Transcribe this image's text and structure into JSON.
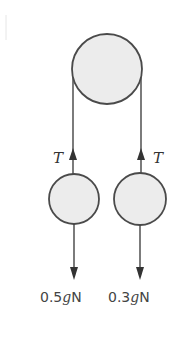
{
  "diagram": {
    "type": "pulley-system",
    "pulley": {
      "cx": 107,
      "cy": 69,
      "r": 35
    },
    "masses": [
      {
        "id": "left",
        "cx": 74,
        "cy": 199,
        "r": 25,
        "tension_label": "T",
        "weight_num": "0.5",
        "weight_g": "g",
        "weight_unit": "N"
      },
      {
        "id": "right",
        "cx": 140,
        "cy": 199,
        "r": 26,
        "tension_label": "T",
        "weight_num": "0.3",
        "weight_g": "g",
        "weight_unit": "N"
      }
    ],
    "colors": {
      "fill": "#ececec",
      "stroke": "#4a4a4a",
      "text": "#444444"
    }
  }
}
